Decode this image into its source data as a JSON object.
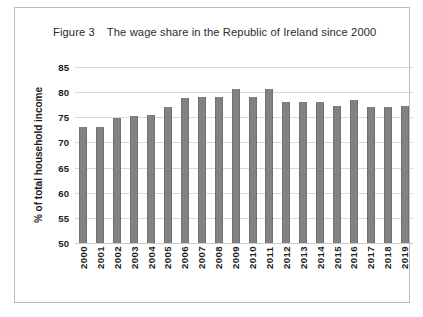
{
  "figure": {
    "number_label": "Figure 3",
    "title": "The wage share in the Republic of Ireland since 2000"
  },
  "chart_data": {
    "type": "bar",
    "title": "The wage share in the Republic of Ireland since 2000",
    "xlabel": "",
    "ylabel": "% of total household income",
    "ylim": [
      50,
      85
    ],
    "yticks": [
      50,
      55,
      60,
      65,
      70,
      75,
      80,
      85
    ],
    "grid": true,
    "legend": null,
    "bar_color": "#808285",
    "categories": [
      "2000",
      "2001",
      "2002",
      "2003",
      "2004",
      "2005",
      "2006",
      "2007",
      "2008",
      "2009",
      "2010",
      "2011",
      "2012",
      "2013",
      "2014",
      "2015",
      "2016",
      "2017",
      "2018",
      "2019"
    ],
    "values": [
      73.0,
      73.0,
      74.9,
      75.2,
      75.4,
      77.0,
      78.9,
      79.0,
      79.0,
      80.6,
      79.1,
      80.6,
      78.0,
      78.1,
      78.1,
      77.2,
      78.4,
      77.0,
      77.0,
      77.2
    ]
  }
}
